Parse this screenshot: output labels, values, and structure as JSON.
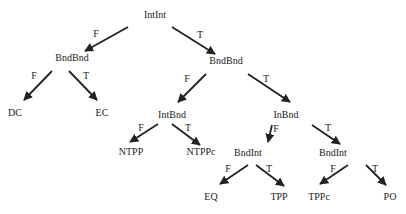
{
  "diagram": {
    "type": "decision-tree",
    "nodes": [
      {
        "id": "n0",
        "label": "IntInt",
        "x": 155,
        "y": 18
      },
      {
        "id": "n1",
        "label": "BndBnd",
        "x": 72,
        "y": 61
      },
      {
        "id": "n2",
        "label": "BndBnd",
        "x": 226,
        "y": 64
      },
      {
        "id": "n3",
        "label": "DC",
        "x": 15,
        "y": 116
      },
      {
        "id": "n4",
        "label": "EC",
        "x": 102,
        "y": 116
      },
      {
        "id": "n5",
        "label": "IntBnd",
        "x": 172,
        "y": 118
      },
      {
        "id": "n6",
        "label": "InBnd",
        "x": 286,
        "y": 118
      },
      {
        "id": "n7",
        "label": "NTPP",
        "x": 131,
        "y": 155
      },
      {
        "id": "n8",
        "label": "NTPPc",
        "x": 201,
        "y": 155
      },
      {
        "id": "n9",
        "label": "BndInt",
        "x": 248,
        "y": 156
      },
      {
        "id": "n10",
        "label": "BndInt",
        "x": 333,
        "y": 156
      },
      {
        "id": "n11",
        "label": "EQ",
        "x": 211,
        "y": 200
      },
      {
        "id": "n12",
        "label": "TPP",
        "x": 279,
        "y": 200
      },
      {
        "id": "n13",
        "label": "TPPc",
        "x": 319,
        "y": 200
      },
      {
        "id": "n14",
        "label": "PO",
        "x": 390,
        "y": 200
      }
    ],
    "edges": [
      {
        "from": "n0",
        "to": "n1",
        "label": "F",
        "x1": 128,
        "y1": 27,
        "x2": 85,
        "y2": 51,
        "lx": 96,
        "ly": 37
      },
      {
        "from": "n0",
        "to": "n2",
        "label": "T",
        "x1": 172,
        "y1": 27,
        "x2": 215,
        "y2": 54,
        "lx": 200,
        "ly": 38
      },
      {
        "from": "n1",
        "to": "n3",
        "label": "F",
        "x1": 52,
        "y1": 71,
        "x2": 24,
        "y2": 100,
        "lx": 34,
        "ly": 79
      },
      {
        "from": "n1",
        "to": "n4",
        "label": "T",
        "x1": 69,
        "y1": 71,
        "x2": 97,
        "y2": 100,
        "lx": 86,
        "ly": 79
      },
      {
        "from": "n2",
        "to": "n5",
        "label": "F",
        "x1": 206,
        "y1": 74,
        "x2": 178,
        "y2": 102,
        "lx": 187,
        "ly": 82
      },
      {
        "from": "n2",
        "to": "n6",
        "label": "T",
        "x1": 248,
        "y1": 74,
        "x2": 290,
        "y2": 102,
        "lx": 266,
        "ly": 82
      },
      {
        "from": "n5",
        "to": "n7",
        "label": "F",
        "x1": 158,
        "y1": 124,
        "x2": 130,
        "y2": 142,
        "lx": 141,
        "ly": 131
      },
      {
        "from": "n5",
        "to": "n8",
        "label": "T",
        "x1": 172,
        "y1": 124,
        "x2": 200,
        "y2": 145,
        "lx": 188,
        "ly": 131
      },
      {
        "from": "n6",
        "to": "n9",
        "label": "F",
        "x1": 272,
        "y1": 125,
        "x2": 268,
        "y2": 142,
        "lx": 276,
        "ly": 132
      },
      {
        "from": "n6",
        "to": "n10",
        "label": "T",
        "x1": 312,
        "y1": 125,
        "x2": 340,
        "y2": 144,
        "lx": 328,
        "ly": 131
      },
      {
        "from": "n9",
        "to": "n11",
        "label": "F",
        "x1": 248,
        "y1": 165,
        "x2": 220,
        "y2": 184,
        "lx": 228,
        "ly": 172
      },
      {
        "from": "n9",
        "to": "n12",
        "label": "T",
        "x1": 256,
        "y1": 165,
        "x2": 284,
        "y2": 186,
        "lx": 269,
        "ly": 172
      },
      {
        "from": "n10",
        "to": "n13",
        "label": "F",
        "x1": 348,
        "y1": 165,
        "x2": 320,
        "y2": 184,
        "lx": 333,
        "ly": 172
      },
      {
        "from": "n10",
        "to": "n14",
        "label": "T",
        "x1": 366,
        "y1": 165,
        "x2": 386,
        "y2": 185,
        "lx": 375,
        "ly": 172
      }
    ]
  }
}
